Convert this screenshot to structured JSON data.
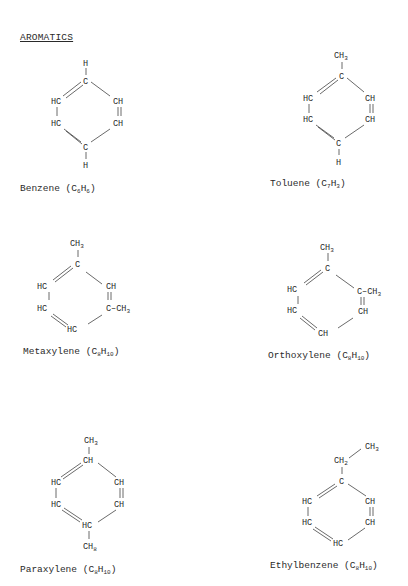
{
  "heading": "AROMATICS",
  "molecules": [
    {
      "name": "Benzene",
      "formula_c": "C",
      "formula_c_sub": "6",
      "formula_h": "H",
      "formula_h_sub": "6",
      "atoms": {
        "top_sub": "H",
        "top": "C",
        "ul": "HC",
        "ll": "HC",
        "ur": "CH",
        "lr": "CH",
        "bottom": "C",
        "bottom_sub": "H"
      }
    },
    {
      "name": "Toluene",
      "formula_c": "C",
      "formula_c_sub": "7",
      "formula_h": "H",
      "formula_h_sub": "3",
      "atoms": {
        "top_sub": "CH",
        "top_sub_n": "3",
        "top": "C",
        "ul": "HC",
        "ll": "HC",
        "ur": "CH",
        "lr": "CH",
        "bottom": "C",
        "bottom_sub": "H"
      }
    },
    {
      "name": "Metaxylene",
      "formula_c": "C",
      "formula_c_sub": "8",
      "formula_h": "H",
      "formula_h_sub": "10",
      "atoms": {
        "top_sub": "CH",
        "top_sub_n": "3",
        "top": "C",
        "ul": "HC",
        "ll": "HC",
        "ur": "CH",
        "lr": "C–CH",
        "lr_n": "3",
        "bottom": "HC"
      }
    },
    {
      "name": "Orthoxylene",
      "formula_c": "C",
      "formula_c_sub": "8",
      "formula_h": "H",
      "formula_h_sub": "10",
      "atoms": {
        "top_sub": "CH",
        "top_sub_n": "3",
        "top": "C",
        "ul": "HC",
        "ll": "HC",
        "ur": "C–CH",
        "ur_n": "3",
        "lr": "CH",
        "bottom": "CH"
      }
    },
    {
      "name": "Paraxylene",
      "formula_c": "C",
      "formula_c_sub": "8",
      "formula_h": "H",
      "formula_h_sub": "10",
      "atoms": {
        "top_sub": "CH",
        "top_sub_n": "3",
        "top": "CH",
        "ul": "HC",
        "ll": "HC",
        "ur": "CH",
        "lr": "CH",
        "bottom": "HC",
        "bottom_sub": "CH",
        "bottom_sub_n": "8"
      }
    },
    {
      "name": "Ethylbenzene",
      "formula_c": "C",
      "formula_c_sub": "8",
      "formula_h": "H",
      "formula_h_sub": "10",
      "atoms": {
        "ethyl_ch3": "CH",
        "ethyl_ch3_n": "3",
        "top_sub": "CH",
        "top_sub_n": "2",
        "top": "C",
        "ul": "HC",
        "ll": "HC",
        "ur": "CH",
        "lr": "CH",
        "bottom": "HC"
      }
    }
  ]
}
